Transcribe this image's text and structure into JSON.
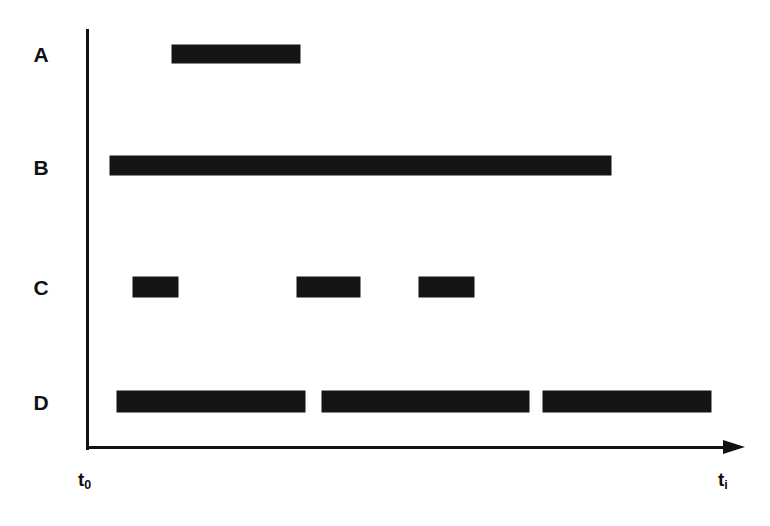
{
  "chart_data": {
    "type": "bar",
    "subtype": "timeline-gantt",
    "title": "",
    "xlabel": "",
    "ylabel": "",
    "grid": false,
    "legend": null,
    "axis_style": {
      "x_axis": "arrow pointing right",
      "y_axis": "plain vertical line",
      "color": "#141414"
    },
    "xlim": [
      0,
      1
    ],
    "x_tick_labels": [
      "t0",
      "ti"
    ],
    "x_tick_label_display": [
      {
        "base": "t",
        "sub": "0"
      },
      {
        "base": "t",
        "sub": "i"
      }
    ],
    "categories": [
      "A",
      "B",
      "C",
      "D"
    ],
    "series": [
      {
        "name": "A",
        "intervals": [
          {
            "start": 0.131,
            "end": 0.324
          }
        ]
      },
      {
        "name": "B",
        "intervals": [
          {
            "start": 0.036,
            "end": 0.795
          }
        ]
      },
      {
        "name": "C",
        "intervals": [
          {
            "start": 0.071,
            "end": 0.139
          },
          {
            "start": 0.32,
            "end": 0.415
          },
          {
            "start": 0.504,
            "end": 0.588
          }
        ]
      },
      {
        "name": "D",
        "intervals": [
          {
            "start": 0.047,
            "end": 0.332
          },
          {
            "start": 0.358,
            "end": 0.671
          },
          {
            "start": 0.692,
            "end": 0.947
          }
        ]
      }
    ]
  },
  "figure": {
    "row_labels": [
      {
        "text": "A"
      },
      {
        "text": "B"
      },
      {
        "text": "C"
      },
      {
        "text": "D"
      }
    ],
    "axis_labels": {
      "start": {
        "base": "t",
        "sub": "0"
      },
      "end": {
        "base": "t",
        "sub": "i"
      }
    }
  }
}
